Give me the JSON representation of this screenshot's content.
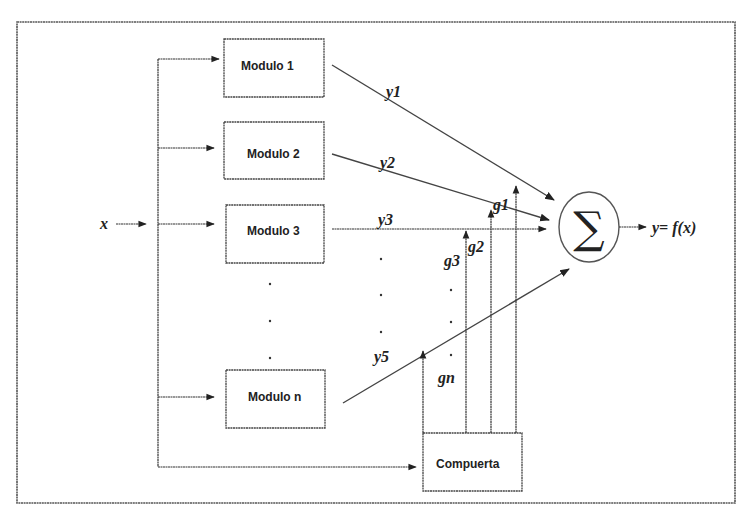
{
  "diagram": {
    "input_label": "x",
    "output_label": "y= f(x)",
    "summation_symbol": "∑",
    "modules": [
      {
        "label": "Modulo 1",
        "output": "y1",
        "gate": "g1"
      },
      {
        "label": "Modulo 2",
        "output": "y2",
        "gate": "g2"
      },
      {
        "label": "Modulo 3",
        "output": "y3",
        "gate": "g3"
      },
      {
        "label": "Modulo n",
        "output": "y5",
        "gate": "gn"
      }
    ],
    "gate_box": {
      "label": "Compuerta"
    },
    "ellipsis": ".",
    "colors": {
      "stroke": "#444444",
      "background": "#ffffff",
      "text": "#222222"
    }
  }
}
